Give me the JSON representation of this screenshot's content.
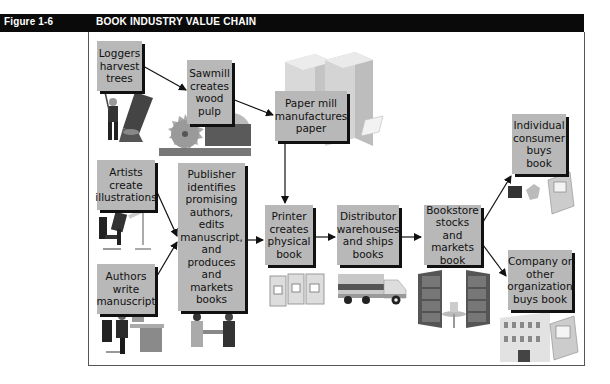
{
  "header": {
    "figure_label": "Figure 1-6",
    "title": "BOOK INDUSTRY VALUE CHAIN"
  },
  "colors": {
    "header_bg": "#0a0a0a",
    "header_text": "#ffffff",
    "box_fill": "#b8b8b8",
    "box_shadow": "#111111",
    "arrow": "#111111"
  },
  "nodes": {
    "loggers": {
      "label": "Loggers harvest trees",
      "icon": "logger-tree-icon"
    },
    "sawmill": {
      "label": "Sawmill creates wood pulp",
      "icon": "saw-blade-icon"
    },
    "paper_mill": {
      "label": "Paper mill manufactures paper",
      "icon": "paper-stack-icon"
    },
    "artists": {
      "label": "Artists create illustrations",
      "icon": "artist-drafting-icon"
    },
    "authors": {
      "label": "Authors write manuscript",
      "icon": "author-desk-icon"
    },
    "publisher": {
      "label": "Publisher identifies promising authors, edits manuscript, and produces and markets books",
      "icon": "handshake-icon"
    },
    "printer": {
      "label": "Printer creates physical book",
      "icon": "printed-books-icon"
    },
    "distributor": {
      "label": "Distributor warehouses and ships books",
      "icon": "truck-icon"
    },
    "bookstore": {
      "label": "Bookstore stocks and markets book",
      "icon": "bookshelves-icon"
    },
    "individual": {
      "label": "Individual consumer buys book",
      "icon": "consumer-computer-icon"
    },
    "company": {
      "label": "Company or other organization buys book",
      "icon": "office-building-icon"
    }
  },
  "edges": [
    [
      "loggers",
      "sawmill"
    ],
    [
      "sawmill",
      "paper_mill"
    ],
    [
      "paper_mill",
      "printer"
    ],
    [
      "artists",
      "publisher"
    ],
    [
      "authors",
      "publisher"
    ],
    [
      "publisher",
      "printer"
    ],
    [
      "printer",
      "distributor"
    ],
    [
      "distributor",
      "bookstore"
    ],
    [
      "bookstore",
      "individual"
    ],
    [
      "bookstore",
      "company"
    ]
  ],
  "box_lines": {
    "loggers": [
      "Loggers",
      "harvest",
      "trees"
    ],
    "sawmill": [
      "Sawmill",
      "creates",
      "wood",
      "pulp"
    ],
    "paper_mill": [
      "Paper mill",
      "manufactures",
      "paper"
    ],
    "artists": [
      "Artists",
      "create",
      "illustrations"
    ],
    "authors": [
      "Authors",
      "write",
      "manuscript"
    ],
    "publisher": [
      "Publisher",
      "identifies",
      "promising",
      "authors,",
      "edits",
      "manuscript,",
      "and",
      "produces",
      "and markets",
      "books"
    ],
    "printer": [
      "Printer",
      "creates",
      "physical",
      "book"
    ],
    "distributor": [
      "Distributor",
      "warehouses",
      "and ships",
      "books"
    ],
    "bookstore": [
      "Bookstore",
      "stocks and",
      "markets",
      "book"
    ],
    "individual": [
      "Individual",
      "consumer",
      "buys",
      "book"
    ],
    "company": [
      "Company or",
      "other",
      "organization",
      "buys book"
    ]
  }
}
